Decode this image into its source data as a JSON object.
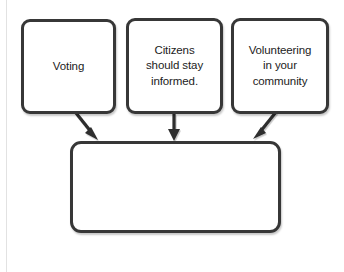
{
  "diagram": {
    "type": "flowchart",
    "background_color": "#ffffff",
    "node_border_color": "#373737",
    "node_fill_color": "#ffffff",
    "arrow_color": "#2d2d2d",
    "nodes": [
      {
        "id": "voting",
        "label": "Voting",
        "shape": "rounded-rectangle",
        "empty": false
      },
      {
        "id": "informed",
        "label": "Citizens\nshould stay\ninformed.",
        "shape": "rounded-rectangle",
        "empty": false
      },
      {
        "id": "volunteering",
        "label": "Volunteering\nin your\ncommunity",
        "shape": "rounded-rectangle",
        "empty": false
      },
      {
        "id": "result",
        "label": "",
        "shape": "rounded-rectangle",
        "empty": true
      }
    ],
    "arrows": [
      {
        "id": "voting-to-result",
        "from": "voting",
        "to": "result",
        "direction": "down-right"
      },
      {
        "id": "informed-to-result",
        "from": "informed",
        "to": "result",
        "direction": "down"
      },
      {
        "id": "volunteering-to-result",
        "from": "volunteering",
        "to": "result",
        "direction": "down-left"
      }
    ],
    "page_rule": {
      "visible": true,
      "color": "#e2e2e2"
    },
    "faint_footer_text": ""
  }
}
